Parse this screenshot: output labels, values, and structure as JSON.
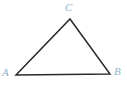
{
  "figure": {
    "kind": "geometry-diagram",
    "shape": "triangle",
    "width": 127,
    "height": 88,
    "background_color": "#ffffff",
    "stroke_color": "#2a2a2a",
    "stroke_width": 1.5,
    "label_color": "#8fb4cc",
    "label_style": "italic-serif",
    "vertices": [
      {
        "id": "A",
        "label": "A",
        "x": 16,
        "y": 75,
        "label_x": 2,
        "label_y": 67,
        "position": "bottom-left"
      },
      {
        "id": "B",
        "label": "B",
        "x": 110,
        "y": 74,
        "label_x": 114,
        "label_y": 66,
        "position": "bottom-right"
      },
      {
        "id": "C",
        "label": "C",
        "x": 70,
        "y": 19,
        "label_x": 65,
        "label_y": 2,
        "position": "apex-top"
      }
    ],
    "edges": [
      {
        "id": "AC",
        "from": "A",
        "to": "C"
      },
      {
        "id": "CB",
        "from": "C",
        "to": "B"
      },
      {
        "id": "BA",
        "from": "B",
        "to": "A"
      }
    ],
    "path_points": "16,75 70,19 110,74 16,75"
  }
}
